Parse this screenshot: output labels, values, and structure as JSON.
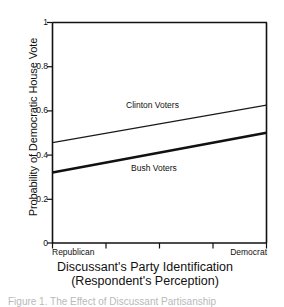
{
  "chart_data": {
    "type": "line",
    "title": "",
    "xlabel": "Discussant's Party Identification",
    "xlabel_line2": "(Respondent's Perception)",
    "ylabel": "Probability of Democratic House Vote",
    "xlim": [
      0,
      1
    ],
    "ylim": [
      0,
      1
    ],
    "grid": false,
    "legend_position": "inline-annotations",
    "x_tick_labels": [
      "Republican",
      "Democrat"
    ],
    "x_tick_positions": [
      0,
      0.25,
      0.5,
      0.75,
      1
    ],
    "y_tick_labels": [
      "0",
      "0.2",
      "0.4",
      "0.6",
      "0.8",
      "1"
    ],
    "y_tick_values": [
      0,
      0.2,
      0.4,
      0.6,
      0.8,
      1
    ],
    "x": [
      0,
      1
    ],
    "series": [
      {
        "name": "Clinton Voters",
        "values": [
          0.455,
          0.625
        ],
        "line_width": 1.2,
        "color": "#1a1a1a"
      },
      {
        "name": "Bush Voters",
        "values": [
          0.32,
          0.5
        ],
        "line_width": 2.6,
        "color": "#111111"
      }
    ],
    "annotations": [
      {
        "text": "Clinton Voters",
        "x": 0.37,
        "y": 0.605
      },
      {
        "text": "Bush Voters",
        "x": 0.4,
        "y": 0.32
      }
    ]
  },
  "axis": {
    "y_title": "Probability of Democratic House Vote",
    "y_ticks": [
      {
        "label": "1",
        "value": 1
      },
      {
        "label": "0.8",
        "value": 0.8
      },
      {
        "label": "0.6",
        "value": 0.6
      },
      {
        "label": "0.4",
        "value": 0.4
      },
      {
        "label": "0.2",
        "value": 0.2
      },
      {
        "label": "0",
        "value": 0
      }
    ],
    "x_title_line1": "Discussant's Party Identification",
    "x_title_line2": "(Respondent's Perception)",
    "x_tick_left": "Republican",
    "x_tick_right": "Democrat"
  },
  "series_labels": {
    "clinton": "Clinton Voters",
    "bush": "Bush Voters"
  },
  "bottom_caption": {
    "text": "Figure 1. The Effect of Discussant Partisanship"
  },
  "colors": {
    "ink": "#111111",
    "background": "#ffffff",
    "faint_text": "#b9b9b9"
  }
}
